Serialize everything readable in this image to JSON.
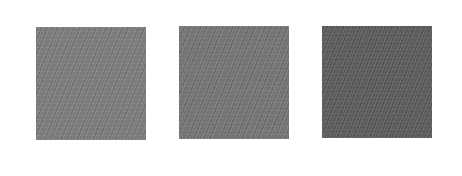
{
  "swatches": [
    {
      "label": "",
      "color": "#7a7a7a"
    },
    {
      "label": "",
      "color": "#737373"
    },
    {
      "label": "",
      "color": "#5a5a5a"
    }
  ],
  "background_color": "#ffffff"
}
